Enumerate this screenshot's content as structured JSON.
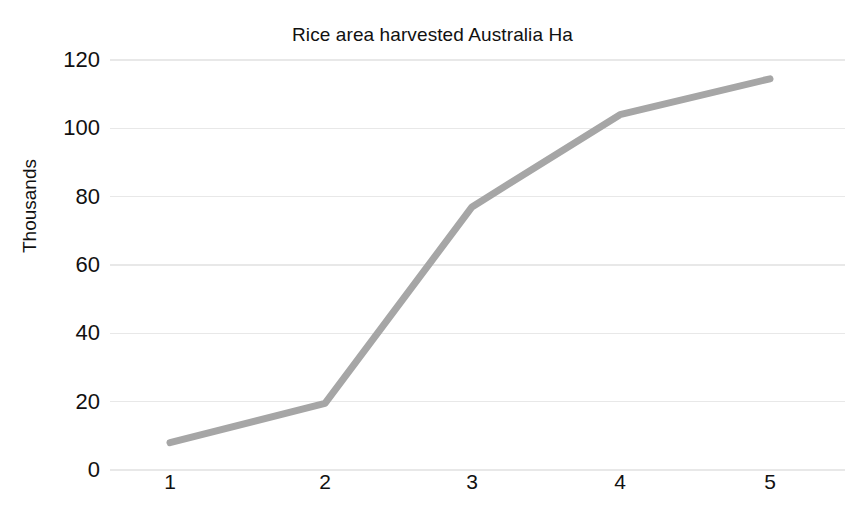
{
  "chart_data": {
    "type": "line",
    "title": "Rice area harvested Australia Ha",
    "xlabel": "",
    "ylabel": "Thousands",
    "categories": [
      "1",
      "2",
      "3",
      "4",
      "5"
    ],
    "values": [
      8,
      19.5,
      77,
      104,
      114.5
    ],
    "series": [
      {
        "name": "Rice area harvested Australia Ha",
        "values": [
          8,
          19.5,
          77,
          104,
          114.5
        ],
        "color": "#A6A6A6"
      }
    ],
    "ylim": [
      0,
      120
    ],
    "ytick_labels": [
      "120",
      "100",
      "80",
      "60",
      "40",
      "20",
      "0"
    ],
    "ytick_values": [
      120,
      100,
      80,
      60,
      40,
      20,
      0
    ],
    "xtick_labels": [
      "1",
      "2",
      "3",
      "4",
      "5"
    ],
    "grid": "horizontal",
    "grid_color": "#E8E8E8",
    "legend": "none",
    "background": "#FFFFFF",
    "line_width": 7
  },
  "chart": {
    "title": "Rice area harvested Australia Ha",
    "y_axis_title": "Thousands"
  }
}
